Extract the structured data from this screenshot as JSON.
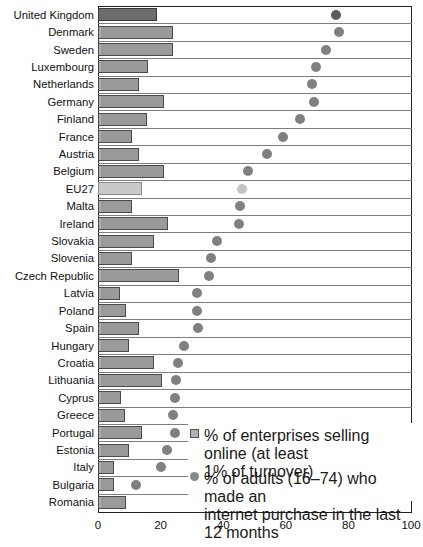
{
  "chart_data": {
    "type": "bar",
    "orientation": "horizontal",
    "title": "",
    "xlabel": "",
    "ylabel": "",
    "xlim": [
      0,
      100
    ],
    "xticks": [
      0,
      20,
      40,
      60,
      80,
      100
    ],
    "grid": true,
    "legend_position": "inside-bottom-right",
    "categories": [
      "United Kingdom",
      "Denmark",
      "Sweden",
      "Luxembourg",
      "Netherlands",
      "Germany",
      "Finland",
      "France",
      "Austria",
      "Belgium",
      "EU27",
      "Malta",
      "Ireland",
      "Slovakia",
      "Slovenia",
      "Czech Republic",
      "Latvia",
      "Poland",
      "Spain",
      "Hungary",
      "Croatia",
      "Lithuania",
      "Cyprus",
      "Greece",
      "Portugal",
      "Estonia",
      "Italy",
      "Bulgaria",
      "Romania"
    ],
    "series": [
      {
        "name": "% of enterprises selling online (at least 1% of turnover)",
        "type": "bar",
        "values": [
          19,
          24,
          24,
          16,
          13,
          21,
          15.5,
          11,
          13,
          21,
          14,
          11,
          22.5,
          18,
          11,
          26,
          7,
          9,
          13,
          10,
          18,
          20.5,
          7.5,
          8.5,
          14,
          10,
          5,
          5,
          9
        ]
      },
      {
        "name": "% of adults (16-74) who made an internet purchase in the last 12 months",
        "type": "scatter",
        "values": [
          76,
          77,
          73,
          69.5,
          68.5,
          69,
          64.5,
          59,
          54,
          48,
          46,
          45.5,
          45,
          38,
          36,
          35.5,
          31.5,
          31.5,
          32,
          27.5,
          25.5,
          25,
          24.5,
          24,
          24.5,
          22,
          20,
          12,
          null
        ]
      }
    ]
  },
  "axis": {
    "tick_labels": [
      "0",
      "20",
      "40",
      "60",
      "80",
      "100"
    ]
  },
  "legend": {
    "items": [
      {
        "marker": "square-swatch",
        "label": "% of enterprises selling online (at least\n1% of turnover)"
      },
      {
        "marker": "circle-swatch",
        "label": "% of adults (16–74) who made an\ninternet purchase in the last 12 months"
      }
    ]
  },
  "colors": {
    "bar_fill": "#9a9a9a",
    "bar_highlight_fill": "#6d6d6d",
    "bar_light_fill": "#c9c9c9",
    "dot_fill": "#808080",
    "dot_light_fill": "#c4c4c4",
    "axis": "#222222",
    "gridline": "#7d7d7d"
  }
}
